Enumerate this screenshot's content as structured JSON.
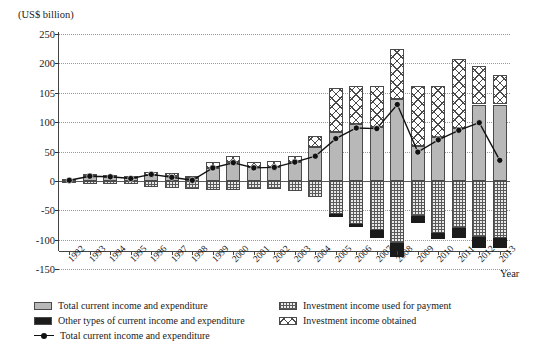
{
  "axis_unit": "(US$ billion)",
  "x_axis_title": "Year",
  "legend": {
    "items": [
      {
        "name": "legend-total-current-income-expenditure-bar",
        "label": "Total current income and expenditure",
        "swatch": "gray-solid"
      },
      {
        "name": "legend-other-types-current-income-expenditure",
        "label": "Other types of current income and expenditure",
        "swatch": "black-solid"
      },
      {
        "name": "legend-total-current-income-expenditure-line",
        "label": "Total current income and expenditure",
        "swatch": "line-marker"
      },
      {
        "name": "legend-investment-income-used-for-payment",
        "label": "Investment income used for payment",
        "swatch": "dotted-hatch"
      },
      {
        "name": "legend-investment-income-obtained",
        "label": "Investment income obtained",
        "swatch": "cross-hatch"
      }
    ]
  },
  "chart_data": {
    "type": "bar",
    "title": "",
    "subtitle": "",
    "xlabel": "Year",
    "ylabel": "(US$ billion)",
    "ylim": [
      -150,
      250
    ],
    "yticks": [
      250,
      200,
      105,
      100,
      50,
      0,
      -50,
      -100,
      -150
    ],
    "ytick_labels": [
      "250",
      "200",
      "105",
      "100",
      "50",
      "0",
      "-50",
      "-100",
      "-150"
    ],
    "grid": true,
    "legend_position": "bottom",
    "stacked": true,
    "categories": [
      "1992",
      "1993",
      "1994",
      "1995",
      "1996",
      "1997",
      "1998",
      "1999",
      "2000",
      "2001",
      "2002",
      "2003",
      "2004",
      "2005",
      "2006",
      "2007",
      "2008",
      "2009",
      "2010",
      "2011",
      "2012",
      "2013"
    ],
    "series": [
      {
        "name": "Total current income and expenditure",
        "pattern": "gray-solid",
        "color": "#b8b8b8",
        "values": [
          2,
          8,
          6,
          5,
          10,
          9,
          5,
          22,
          32,
          23,
          24,
          32,
          58,
          84,
          97,
          92,
          104,
          60,
          74,
          90,
          103,
          103
        ]
      },
      {
        "name": "Investment income obtained",
        "pattern": "cross-hatch",
        "color": "#ffffff",
        "values": [
          2,
          4,
          4,
          4,
          5,
          5,
          4,
          10,
          11,
          9,
          9,
          11,
          18,
          36,
          31,
          36,
          121,
          67,
          52,
          118,
          90,
          60
        ]
      },
      {
        "name": "Investment income used for payment",
        "pattern": "dotted-hatch",
        "color": "#e9e9e9",
        "values": [
          -3,
          -5,
          -5,
          -6,
          -10,
          -12,
          -13,
          -15,
          -16,
          -14,
          -13,
          -17,
          -27,
          -57,
          -73,
          -83,
          -105,
          -60,
          -88,
          -80,
          -95,
          -98
        ]
      },
      {
        "name": "Other types of current income and expenditure",
        "pattern": "black-solid",
        "color": "#1b1b1b",
        "values": [
          0,
          0,
          0,
          0,
          0,
          0,
          0,
          0,
          0,
          0,
          0,
          0,
          0,
          -4,
          -6,
          -14,
          -25,
          -12,
          -11,
          -17,
          -20,
          -17
        ]
      }
    ],
    "line_series": {
      "name": "Total current income and expenditure",
      "color": "#111111",
      "marker": "filled-circle",
      "values": [
        1,
        8,
        7,
        4,
        11,
        6,
        1,
        22,
        31,
        22,
        23,
        32,
        42,
        72,
        90,
        89,
        103,
        49,
        70,
        86,
        99,
        35
      ]
    }
  }
}
